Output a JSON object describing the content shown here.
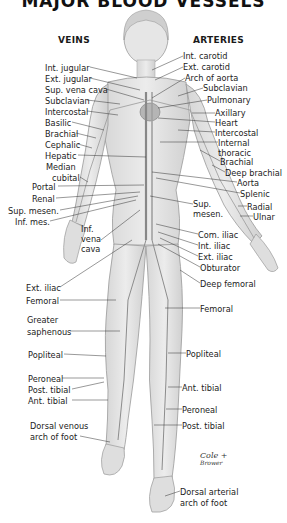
{
  "title": "MAJOR BLOOD VESSELS",
  "headings": {
    "veins": "VEINS",
    "arteries": "ARTERIES"
  },
  "veins": [
    {
      "label": "Int. jugular",
      "x": 45,
      "y": 63
    },
    {
      "label": "Ext. jugular",
      "x": 45,
      "y": 74
    },
    {
      "label": "Sup. vena cava",
      "x": 45,
      "y": 85
    },
    {
      "label": "Subclavian",
      "x": 45,
      "y": 96
    },
    {
      "label": "Intercostal",
      "x": 45,
      "y": 107
    },
    {
      "label": "Basilic",
      "x": 45,
      "y": 118
    },
    {
      "label": "Brachial",
      "x": 45,
      "y": 129
    },
    {
      "label": "Cephalic",
      "x": 45,
      "y": 140
    },
    {
      "label": "Hepatic",
      "x": 45,
      "y": 151
    },
    {
      "label": "Median",
      "x": 46,
      "y": 162
    },
    {
      "label": "cubital",
      "x": 52,
      "y": 173
    },
    {
      "label": "Portal",
      "x": 32,
      "y": 182
    },
    {
      "label": "Renal",
      "x": 32,
      "y": 194
    },
    {
      "label": "Sup. mesen.",
      "x": 8,
      "y": 206
    },
    {
      "label": "Inf. mes.",
      "x": 15,
      "y": 217
    },
    {
      "label": "Inf.",
      "x": 81,
      "y": 224
    },
    {
      "label": "vena",
      "x": 81,
      "y": 234
    },
    {
      "label": "cava",
      "x": 81,
      "y": 244
    },
    {
      "label": "Ext. iliac",
      "x": 26,
      "y": 283
    },
    {
      "label": "Femoral",
      "x": 26,
      "y": 296
    },
    {
      "label": "Greater",
      "x": 27,
      "y": 315
    },
    {
      "label": "saphenous",
      "x": 27,
      "y": 327
    },
    {
      "label": "Popliteal",
      "x": 28,
      "y": 350
    },
    {
      "label": "Peroneal",
      "x": 28,
      "y": 374
    },
    {
      "label": "Post. tibial",
      "x": 28,
      "y": 385
    },
    {
      "label": "Ant. tibial",
      "x": 28,
      "y": 396
    },
    {
      "label": "Dorsal venous",
      "x": 30,
      "y": 421
    },
    {
      "label": "arch of foot",
      "x": 30,
      "y": 432
    }
  ],
  "arteries": [
    {
      "label": "Int. carotid",
      "x": 183,
      "y": 51
    },
    {
      "label": "Ext. carotid",
      "x": 183,
      "y": 62
    },
    {
      "label": "Arch of aorta",
      "x": 185,
      "y": 73
    },
    {
      "label": "Subclavian",
      "x": 203,
      "y": 83
    },
    {
      "label": "Pulmonary",
      "x": 207,
      "y": 95
    },
    {
      "label": "Axillary",
      "x": 215,
      "y": 108
    },
    {
      "label": "Heart",
      "x": 215,
      "y": 118
    },
    {
      "label": "Intercostal",
      "x": 215,
      "y": 128
    },
    {
      "label": "Internal",
      "x": 218,
      "y": 138
    },
    {
      "label": "thoracic",
      "x": 218,
      "y": 148
    },
    {
      "label": "Brachial",
      "x": 220,
      "y": 157
    },
    {
      "label": "Deep brachial",
      "x": 225,
      "y": 168
    },
    {
      "label": "Aorta",
      "x": 237,
      "y": 178
    },
    {
      "label": "Splenic",
      "x": 240,
      "y": 189
    },
    {
      "label": "Sup.",
      "x": 193,
      "y": 199
    },
    {
      "label": "mesen.",
      "x": 193,
      "y": 209
    },
    {
      "label": "Radial",
      "x": 247,
      "y": 202
    },
    {
      "label": "Ulnar",
      "x": 253,
      "y": 212
    },
    {
      "label": "Com. iliac",
      "x": 198,
      "y": 230
    },
    {
      "label": "Int. iliac",
      "x": 198,
      "y": 241
    },
    {
      "label": "Ext. iliac",
      "x": 198,
      "y": 252
    },
    {
      "label": "Obturator",
      "x": 200,
      "y": 263
    },
    {
      "label": "Deep femoral",
      "x": 200,
      "y": 279
    },
    {
      "label": "Femoral",
      "x": 200,
      "y": 304
    },
    {
      "label": "Popliteal",
      "x": 186,
      "y": 349
    },
    {
      "label": "Ant. tibial",
      "x": 182,
      "y": 383
    },
    {
      "label": "Peroneal",
      "x": 182,
      "y": 405
    },
    {
      "label": "Post. tibial",
      "x": 182,
      "y": 421
    },
    {
      "label": "Dorsal arterial",
      "x": 180,
      "y": 487
    },
    {
      "label": "arch of foot",
      "x": 180,
      "y": 498
    }
  ],
  "signature": {
    "line1": "Cole +",
    "line2": "Brower"
  }
}
